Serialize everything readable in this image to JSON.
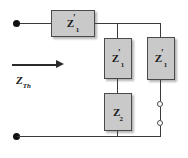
{
  "figure": {
    "type": "circuit-diagram",
    "background_color": "#ffffff",
    "wire_color": "#3a3a3a",
    "block_fill_color": "#c9c9c9",
    "block_border_color": "#4a4a4a"
  },
  "source_label": {
    "symbol": "Z",
    "subscript": "Th",
    "arrow_direction": "right"
  },
  "components": [
    {
      "id": "series-z1",
      "name": "series-impedance-z1-prime",
      "symbol": "Z",
      "prime": "′",
      "subscript": "1",
      "orientation": "horizontal",
      "position": "top-left-series"
    },
    {
      "id": "shunt-z1-middle",
      "name": "middle-branch-impedance-z1-prime",
      "symbol": "Z",
      "prime": "′",
      "subscript": "1",
      "orientation": "vertical",
      "position": "middle-branch-upper"
    },
    {
      "id": "shunt-z2",
      "name": "middle-branch-impedance-z2",
      "symbol": "Z",
      "prime": "",
      "subscript": "2",
      "orientation": "vertical",
      "position": "middle-branch-lower"
    },
    {
      "id": "shunt-z1-right",
      "name": "right-branch-impedance-z1-prime",
      "symbol": "Z",
      "prime": "′",
      "subscript": "1",
      "orientation": "vertical",
      "position": "right-branch-upper"
    }
  ],
  "terminals": {
    "input": [
      {
        "name": "input-terminal-top",
        "style": "filled-dot"
      },
      {
        "name": "input-terminal-bottom",
        "style": "filled-dot"
      }
    ],
    "output": [
      {
        "name": "output-terminal-upper",
        "style": "open-circle"
      },
      {
        "name": "output-terminal-lower",
        "style": "open-circle"
      }
    ]
  }
}
